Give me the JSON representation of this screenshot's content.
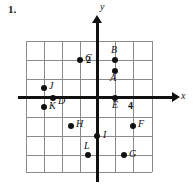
{
  "figure": {
    "problem_number": "1.",
    "axis_labels": {
      "x": "x",
      "y": "y"
    },
    "tick_labels": [
      {
        "text": "2",
        "axis": "y",
        "value": 2
      },
      {
        "text": "4",
        "axis": "x",
        "value": 4
      }
    ]
  },
  "chart_data": {
    "type": "scatter",
    "title": "",
    "xlabel": "x",
    "ylabel": "y",
    "grid": true,
    "legend": "none",
    "xlim": [
      -6,
      8
    ],
    "ylim": [
      -8,
      6
    ],
    "xticks": [
      4
    ],
    "yticks": [
      2
    ],
    "grid_step": 2,
    "grid_columns": 7,
    "grid_rows": 7,
    "annotations": [],
    "points": [
      {
        "label": "A",
        "x": 2,
        "y": 3,
        "label_pos": "below"
      },
      {
        "label": "B",
        "x": 2,
        "y": 5,
        "label_pos": "above"
      },
      {
        "label": "C",
        "x": -2,
        "y": 5,
        "label_pos": "right"
      },
      {
        "label": "D",
        "x": -5,
        "y": 0,
        "label_pos": "right"
      },
      {
        "label": "E",
        "x": 2,
        "y": 0,
        "label_pos": "below"
      },
      {
        "label": "F",
        "x": 4,
        "y": -3,
        "label_pos": "right"
      },
      {
        "label": "G",
        "x": 3,
        "y": -6,
        "label_pos": "right"
      },
      {
        "label": "H",
        "x": -3,
        "y": -3,
        "label_pos": "right"
      },
      {
        "label": "I",
        "x": 0,
        "y": -4,
        "label_pos": "right"
      },
      {
        "label": "J",
        "x": -6,
        "y": 1,
        "label_pos": "right"
      },
      {
        "label": "K",
        "x": -6,
        "y": -1,
        "label_pos": "right"
      },
      {
        "label": "L",
        "x": -1,
        "y": -6,
        "label_pos": "above"
      }
    ]
  },
  "geometry": {
    "grid_left": 26,
    "grid_top": 41,
    "cell_w": 18,
    "cell_h": 18.714,
    "origin_col": 4,
    "origin_row": 3,
    "points_px": [
      {
        "label": "A",
        "cx": 115,
        "cy": 71,
        "lx": 110,
        "ly": 73
      },
      {
        "label": "B",
        "cx": 115,
        "cy": 60,
        "lx": 111,
        "ly": 45
      },
      {
        "label": "C",
        "cx": 80,
        "cy": 60,
        "lx": 85,
        "ly": 53
      },
      {
        "label": "D",
        "cx": 53,
        "cy": 98,
        "lx": 58,
        "ly": 96
      },
      {
        "label": "E",
        "cx": 115,
        "cy": 98,
        "lx": 112,
        "ly": 100
      },
      {
        "label": "F",
        "cx": 133,
        "cy": 126,
        "lx": 138,
        "ly": 119
      },
      {
        "label": "G",
        "cx": 124,
        "cy": 155,
        "lx": 129,
        "ly": 149
      },
      {
        "label": "H",
        "cx": 71,
        "cy": 126,
        "lx": 76,
        "ly": 119
      },
      {
        "label": "I",
        "cx": 97,
        "cy": 136,
        "lx": 103,
        "ly": 130
      },
      {
        "label": "J",
        "cx": 44,
        "cy": 88,
        "lx": 49,
        "ly": 81
      },
      {
        "label": "K",
        "cx": 44,
        "cy": 107,
        "lx": 49,
        "ly": 101
      },
      {
        "label": "L",
        "cx": 88,
        "cy": 155,
        "lx": 84,
        "ly": 141
      }
    ],
    "grid_v": [
      26,
      44,
      62,
      80,
      97,
      115,
      133,
      152
    ],
    "grid_h": [
      41,
      60,
      79,
      98,
      117,
      136,
      155,
      172
    ]
  }
}
